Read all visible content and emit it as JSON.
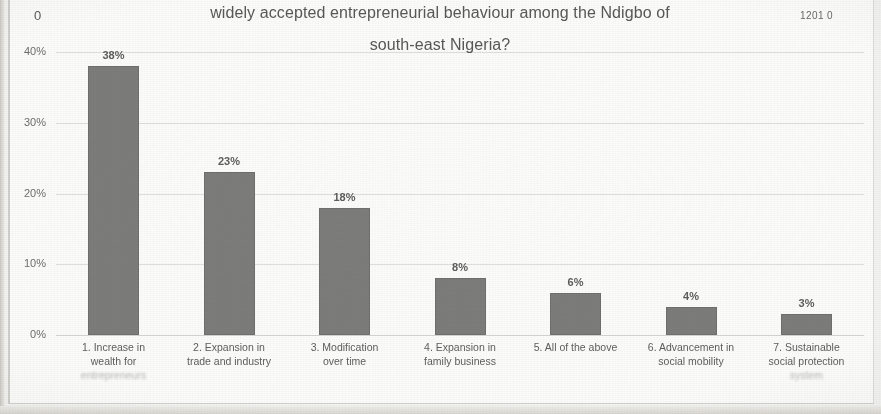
{
  "scan": {
    "corner_left_number": "0",
    "corner_right_number": "1201 0"
  },
  "chart_data": {
    "type": "bar",
    "title": "widely accepted entrepreneurial behaviour among the Ndigbo of south-east Nigeria?",
    "title_lines": [
      "widely accepted entrepreneurial behaviour among the Ndigbo of",
      "south-east Nigeria?"
    ],
    "xlabel": "",
    "ylabel": "",
    "ylim": [
      0,
      40
    ],
    "grid": true,
    "legend": "none",
    "ytick_labels": [
      "40%",
      "30%",
      "20%",
      "10%",
      "0%"
    ],
    "ytick_values": [
      40,
      30,
      20,
      10,
      0
    ],
    "categories": [
      "1. Increase in wealth for entrepreneurs",
      "2. Expansion in trade and industry",
      "3. Modification over time",
      "4. Expansion in family business",
      "5. All of the above",
      "6. Advancement in social mobility",
      "7. Sustainable social protection system"
    ],
    "category_lines": [
      [
        "1. Increase in",
        "wealth for",
        "entrepreneurs"
      ],
      [
        "2. Expansion in",
        "trade and industry"
      ],
      [
        "3. Modification",
        "over time"
      ],
      [
        "4. Expansion in",
        "family business"
      ],
      [
        "5. All of the above"
      ],
      [
        "6. Advancement in",
        "social mobility"
      ],
      [
        "7. Sustainable",
        "social protection",
        "system"
      ]
    ],
    "values": [
      38,
      23,
      18,
      8,
      6,
      4,
      3
    ],
    "value_labels": [
      "38%",
      "23%",
      "18%",
      "8%",
      "6%",
      "4%",
      "3%"
    ],
    "bar_color": "#7c7c7a",
    "gridline_color": "#dedede",
    "text_color": "#5e5e5c"
  }
}
